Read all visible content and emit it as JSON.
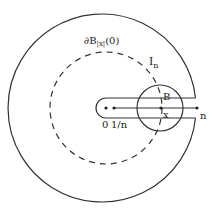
{
  "diagram": {
    "colors": {
      "stroke": "#333333",
      "background": "#ffffff",
      "text": "#222222"
    },
    "labels": {
      "boundary_ball": "∂B",
      "boundary_ball_sub": "|x|",
      "boundary_ball_arg": "(0)",
      "arc_label": "I",
      "arc_label_sub": "n",
      "small_ball": "B",
      "point_x": "x",
      "point_zero": "0",
      "point_inv_n": "1/n",
      "point_n": "n"
    },
    "geometry": {
      "center": [
        106,
        108
      ],
      "outer_radius": 94,
      "dashed_radius": 56,
      "slit_half_width": 10,
      "slit_left": 96,
      "slit_right": 195,
      "small_ball_center": [
        160,
        108
      ],
      "small_ball_radius": 23,
      "points": {
        "zero": [
          106,
          108
        ],
        "inv_n": [
          114,
          108
        ],
        "x": [
          161,
          108
        ],
        "n": [
          197,
          108
        ]
      }
    }
  }
}
